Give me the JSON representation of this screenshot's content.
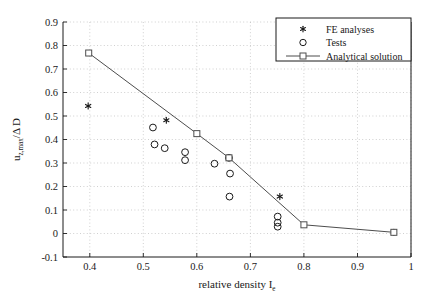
{
  "chart_data": {
    "type": "scatter",
    "title": "",
    "xlabel": "relative density I",
    "xlabel_sub": "e",
    "ylabel_main": "u",
    "ylabel_sub": "z,max",
    "ylabel_rest": "/Δ D",
    "xlim": [
      0.35,
      1.0
    ],
    "ylim": [
      -0.1,
      0.9
    ],
    "xticks": [
      "0.4",
      "0.5",
      "0.6",
      "0.7",
      "0.8",
      "0.9",
      "1"
    ],
    "xtick_values": [
      0.4,
      0.5,
      0.6,
      0.7,
      0.8,
      0.9,
      1.0
    ],
    "yticks": [
      "-0.1",
      "0",
      "0.1",
      "0.2",
      "0.3",
      "0.4",
      "0.5",
      "0.6",
      "0.7",
      "0.8",
      "0.9"
    ],
    "ytick_values": [
      -0.1,
      0,
      0.1,
      0.2,
      0.3,
      0.4,
      0.5,
      0.6,
      0.7,
      0.8,
      0.9
    ],
    "grid": true,
    "grid_style": "dotted",
    "grid_color": "#bcbcbc",
    "axis_color": "#1a1a1a",
    "series": [
      {
        "name": "FE analyses",
        "marker": "star",
        "color": "#1a1a1a",
        "points": [
          {
            "x": 0.397,
            "y": 0.543
          },
          {
            "x": 0.543,
            "y": 0.482
          },
          {
            "x": 0.755,
            "y": 0.157
          },
          {
            "x": 0.968,
            "y": 0.005
          }
        ]
      },
      {
        "name": "Tests",
        "marker": "circle",
        "color": "#1a1a1a",
        "points": [
          {
            "x": 0.518,
            "y": 0.451
          },
          {
            "x": 0.521,
            "y": 0.379
          },
          {
            "x": 0.54,
            "y": 0.363
          },
          {
            "x": 0.578,
            "y": 0.346
          },
          {
            "x": 0.578,
            "y": 0.312
          },
          {
            "x": 0.633,
            "y": 0.297
          },
          {
            "x": 0.66,
            "y": 0.322
          },
          {
            "x": 0.662,
            "y": 0.255
          },
          {
            "x": 0.661,
            "y": 0.157
          },
          {
            "x": 0.751,
            "y": 0.072
          },
          {
            "x": 0.751,
            "y": 0.046
          },
          {
            "x": 0.751,
            "y": 0.029
          }
        ]
      },
      {
        "name": "Analytical solution",
        "marker": "square-line",
        "color": "#4d4d4d",
        "points": [
          {
            "x": 0.398,
            "y": 0.768
          },
          {
            "x": 0.6,
            "y": 0.425
          },
          {
            "x": 0.66,
            "y": 0.322
          },
          {
            "x": 0.8,
            "y": 0.037
          },
          {
            "x": 0.968,
            "y": 0.005
          }
        ]
      }
    ],
    "legend": {
      "position": "top-right",
      "entries": [
        {
          "label": "FE analyses",
          "marker": "star"
        },
        {
          "label": "Tests",
          "marker": "circle"
        },
        {
          "label": "Analytical solution",
          "marker": "square-line"
        }
      ]
    }
  }
}
